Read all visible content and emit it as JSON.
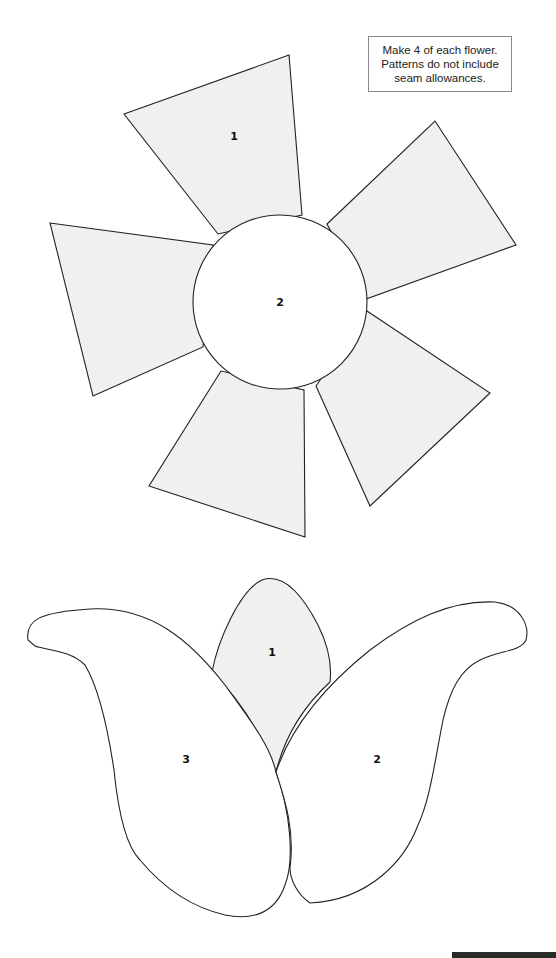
{
  "note": {
    "lines": [
      "Make 4 of each flower.",
      "Patterns do not include",
      "seam allowances."
    ]
  },
  "colors": {
    "petal_fill": "#f0f0f0",
    "outline": "#222222",
    "background": "#ffffff",
    "footer_bar": "#2a2a2a"
  },
  "flower_a": {
    "name": "six-petal flower",
    "center_label": "2",
    "petal_label": "1",
    "petal_count": 5
  },
  "flower_b": {
    "name": "tulip",
    "center_petal_label": "1",
    "right_petal_label": "2",
    "left_petal_label": "3"
  }
}
